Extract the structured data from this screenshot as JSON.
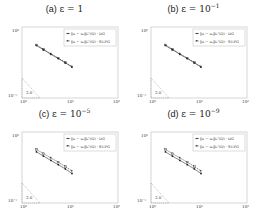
{
  "figure": {
    "panels": [
      {
        "id": "a",
        "label": "(a)",
        "epsilon_text": "ε = 1",
        "eps_base": "1",
        "eps_exp": ""
      },
      {
        "id": "b",
        "label": "(b)",
        "epsilon_text": "ε = 10⁻¹",
        "eps_base": "10",
        "eps_exp": "−1"
      },
      {
        "id": "c",
        "label": "(c)",
        "epsilon_text": "ε = 10⁻⁵",
        "eps_base": "10",
        "eps_exp": "−5"
      },
      {
        "id": "d",
        "label": "(d)",
        "epsilon_text": "ε = 10⁻⁹",
        "eps_base": "10",
        "eps_exp": "−9"
      }
    ],
    "eps_prefix": "ε = ",
    "legend": {
      "dg": "‖u − u_h‖_{L²(Ω)} · DG",
      "supg": "‖u − u_h‖_{L²(Ω)} · SUPG",
      "dg_display": "‖u − uₕ‖L²(Ω) · DG",
      "supg_display": "‖u − uₕ‖L²(Ω) · SUPG"
    },
    "axes": {
      "x_ticks": [
        "10⁰",
        "10¹",
        "10²"
      ],
      "y_ticks": [
        "10⁰",
        "10⁻⁵"
      ],
      "x_scale": "log",
      "y_scale": "log"
    },
    "slope_label": "2.0",
    "colors": {
      "line": "#333333",
      "axis": "#bbbbbb",
      "legend_border": "#bbbbbb",
      "marker": "#222222"
    }
  },
  "chart_data": [
    {
      "type": "line",
      "title": "(a) ε = 1",
      "xlabel": "",
      "ylabel": "",
      "x_scale": "log",
      "y_scale": "log",
      "xlim": [
        1,
        100
      ],
      "ylim": [
        1e-05,
        1
      ],
      "x_ticks": [
        "10^0",
        "10^1",
        "10^2"
      ],
      "y_ticks": [
        "10^-5",
        "10^0"
      ],
      "legend_position": "upper right",
      "x": [
        2,
        2.8,
        4,
        5.7,
        8,
        11
      ],
      "series": [
        {
          "name": "‖u − u_h‖_{L²(Ω)} · DG",
          "values": [
            0.05,
            0.025,
            0.012,
            0.006,
            0.003,
            0.0015
          ]
        },
        {
          "name": "‖u − u_h‖_{L²(Ω)} · SUPG",
          "values": [
            0.055,
            0.027,
            0.013,
            0.0065,
            0.0032,
            0.0016
          ]
        }
      ],
      "annotations": [
        {
          "text": "2.0",
          "type": "slope-triangle",
          "position": "lower left"
        }
      ]
    },
    {
      "type": "line",
      "title": "(b) ε = 10^-1",
      "xlabel": "",
      "ylabel": "",
      "x_scale": "log",
      "y_scale": "log",
      "xlim": [
        1,
        100
      ],
      "ylim": [
        1e-05,
        1
      ],
      "x_ticks": [
        "10^0",
        "10^1",
        "10^2"
      ],
      "y_ticks": [
        "10^-5",
        "10^0"
      ],
      "legend_position": "upper right",
      "x": [
        2,
        2.8,
        4,
        5.7,
        8,
        11
      ],
      "series": [
        {
          "name": "‖u − u_h‖_{L²(Ω)} · DG",
          "values": [
            0.05,
            0.025,
            0.012,
            0.006,
            0.003,
            0.0015
          ]
        },
        {
          "name": "‖u − u_h‖_{L²(Ω)} · SUPG",
          "values": [
            0.055,
            0.027,
            0.013,
            0.0065,
            0.0032,
            0.0016
          ]
        }
      ],
      "annotations": [
        {
          "text": "2.0",
          "type": "slope-triangle",
          "position": "lower left"
        }
      ]
    },
    {
      "type": "line",
      "title": "(c) ε = 10^-5",
      "xlabel": "",
      "ylabel": "",
      "x_scale": "log",
      "y_scale": "log",
      "xlim": [
        1,
        100
      ],
      "ylim": [
        1e-05,
        1
      ],
      "x_ticks": [
        "10^0",
        "10^1",
        "10^2"
      ],
      "y_ticks": [
        "10^-5",
        "10^0"
      ],
      "legend_position": "upper right",
      "x": [
        2,
        2.8,
        4,
        5.7,
        8,
        11
      ],
      "series": [
        {
          "name": "‖u − u_h‖_{L²(Ω)} · DG",
          "values": [
            0.04,
            0.02,
            0.01,
            0.005,
            0.0025,
            0.0012
          ]
        },
        {
          "name": "‖u − u_h‖_{L²(Ω)} · SUPG",
          "values": [
            0.06,
            0.03,
            0.015,
            0.0075,
            0.0037,
            0.0018
          ]
        }
      ],
      "annotations": [
        {
          "text": "2.0",
          "type": "slope-triangle",
          "position": "lower left"
        }
      ]
    },
    {
      "type": "line",
      "title": "(d) ε = 10^-9",
      "xlabel": "",
      "ylabel": "",
      "x_scale": "log",
      "y_scale": "log",
      "xlim": [
        1,
        100
      ],
      "ylim": [
        1e-05,
        1
      ],
      "x_ticks": [
        "10^0",
        "10^1",
        "10^2"
      ],
      "y_ticks": [
        "10^-5",
        "10^0"
      ],
      "legend_position": "upper right",
      "x": [
        2,
        2.8,
        4,
        5.7,
        8,
        11
      ],
      "series": [
        {
          "name": "‖u − u_h‖_{L²(Ω)} · DG",
          "values": [
            0.04,
            0.02,
            0.01,
            0.005,
            0.0025,
            0.0012
          ]
        },
        {
          "name": "‖u − u_h‖_{L²(Ω)} · SUPG",
          "values": [
            0.06,
            0.03,
            0.015,
            0.0075,
            0.0037,
            0.0018
          ]
        }
      ],
      "annotations": [
        {
          "text": "2.0",
          "type": "slope-triangle",
          "position": "lower left"
        }
      ]
    }
  ]
}
